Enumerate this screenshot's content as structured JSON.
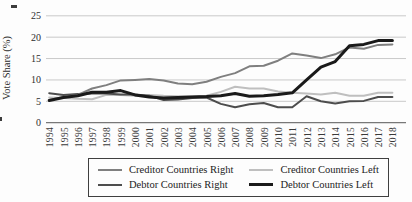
{
  "figure": {
    "background": "#fdfdfd"
  },
  "chart_data": {
    "type": "line",
    "title": "",
    "xlabel": "",
    "ylabel": "Vote Share (%)",
    "ylim": [
      0,
      25
    ],
    "yticks": [
      0,
      5,
      10,
      15,
      20,
      25
    ],
    "grid": true,
    "legend_position": "bottom-center",
    "x": [
      1994,
      1995,
      1996,
      1997,
      1998,
      1999,
      2000,
      2001,
      2002,
      2003,
      2004,
      2005,
      2006,
      2007,
      2008,
      2009,
      2010,
      2011,
      2012,
      2013,
      2014,
      2015,
      2016,
      2017,
      2018
    ],
    "series": [
      {
        "name": "Creditor Countries Right",
        "color": "#7f7f7f",
        "width": 2,
        "values": [
          5.3,
          6.0,
          6.5,
          8.0,
          8.8,
          9.9,
          10.0,
          10.2,
          9.9,
          9.2,
          9.0,
          9.6,
          10.7,
          11.6,
          13.2,
          13.3,
          14.5,
          16.2,
          15.7,
          15.1,
          16.0,
          17.6,
          17.3,
          18.2,
          18.3
        ]
      },
      {
        "name": "Creditor Countries Left",
        "color": "#bfbfbf",
        "width": 2,
        "values": [
          5.9,
          5.8,
          5.6,
          5.5,
          6.5,
          6.5,
          6.3,
          6.5,
          6.3,
          6.2,
          6.2,
          6.3,
          7.2,
          8.4,
          8.0,
          8.0,
          7.3,
          7.0,
          6.8,
          6.6,
          7.0,
          6.3,
          6.3,
          7.0,
          7.0
        ]
      },
      {
        "name": "Debtor Countries Right",
        "color": "#4d4d4d",
        "width": 2,
        "values": [
          6.9,
          6.5,
          6.7,
          6.8,
          6.8,
          6.6,
          6.6,
          6.3,
          5.3,
          5.4,
          5.8,
          5.9,
          4.4,
          3.6,
          4.3,
          4.6,
          3.6,
          3.6,
          6.2,
          5.0,
          4.5,
          5.0,
          5.1,
          6.0,
          6.0
        ]
      },
      {
        "name": "Debtor Countries Left",
        "color": "#1a1a1a",
        "width": 3,
        "values": [
          5.2,
          5.9,
          6.3,
          7.1,
          7.1,
          7.5,
          6.5,
          6.0,
          5.8,
          5.9,
          6.0,
          6.1,
          6.3,
          6.8,
          6.2,
          6.3,
          6.6,
          7.0,
          10.0,
          13.0,
          14.3,
          18.0,
          18.3,
          19.2,
          19.2
        ]
      }
    ]
  },
  "colors": {
    "gridline": "#c9c9c9",
    "axis": "#787878",
    "tick_text": "#2e2e2e",
    "legend_border": "#3f3f3f"
  }
}
